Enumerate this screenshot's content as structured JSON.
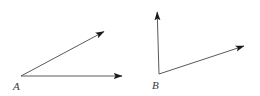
{
  "figure": {
    "background_color": "#ffffff",
    "stroke_color": "#5a5a5a",
    "arrow_color": "#1a1a1a",
    "label_color": "#3a3a3a",
    "stroke_width": 1,
    "angles": [
      {
        "name": "angle-a",
        "vertex_label": "A",
        "vertex": {
          "x": 21,
          "y": 76
        },
        "label_position": {
          "x": 13,
          "y": 90
        },
        "rays": [
          {
            "name": "ray-a-upper",
            "from": {
              "x": 21,
              "y": 76
            },
            "to": {
              "x": 107,
              "y": 30
            },
            "direction": "upper-right-diagonal",
            "arrow": true
          },
          {
            "name": "ray-a-horizontal",
            "from": {
              "x": 21,
              "y": 76
            },
            "to": {
              "x": 125,
              "y": 76
            },
            "direction": "right-horizontal",
            "arrow": true
          }
        ]
      },
      {
        "name": "angle-b",
        "vertex_label": "B",
        "vertex": {
          "x": 159,
          "y": 74
        },
        "label_position": {
          "x": 152,
          "y": 89
        },
        "rays": [
          {
            "name": "ray-b-vertical",
            "from": {
              "x": 159,
              "y": 74
            },
            "to": {
              "x": 157,
              "y": 5
            },
            "direction": "up-vertical",
            "arrow": true
          },
          {
            "name": "ray-b-diagonal",
            "from": {
              "x": 159,
              "y": 74
            },
            "to": {
              "x": 247,
              "y": 45
            },
            "direction": "upper-right-diagonal",
            "arrow": true
          }
        ]
      }
    ]
  }
}
